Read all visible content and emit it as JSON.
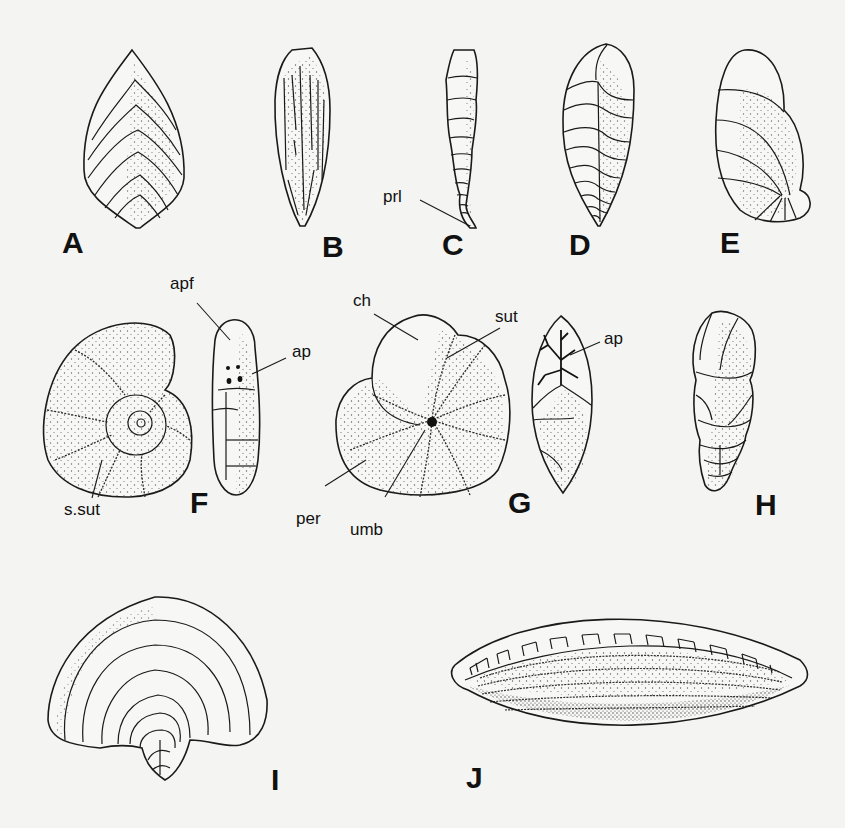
{
  "figure": {
    "panels": [
      {
        "id": "A",
        "label": "A"
      },
      {
        "id": "B",
        "label": "B"
      },
      {
        "id": "C",
        "label": "C"
      },
      {
        "id": "D",
        "label": "D"
      },
      {
        "id": "E",
        "label": "E"
      },
      {
        "id": "F",
        "label": "F"
      },
      {
        "id": "G",
        "label": "G"
      },
      {
        "id": "H",
        "label": "H"
      },
      {
        "id": "I",
        "label": "I"
      },
      {
        "id": "J",
        "label": "J"
      }
    ],
    "annotations": {
      "prl": "prl",
      "apf": "apf",
      "ap_f": "ap",
      "s_sut": "s.sut",
      "ch": "ch",
      "sut": "sut",
      "ap_g": "ap",
      "per": "per",
      "umb": "umb"
    },
    "colors": {
      "background": "#f4f4f2",
      "ink": "#1a1a1a"
    }
  }
}
